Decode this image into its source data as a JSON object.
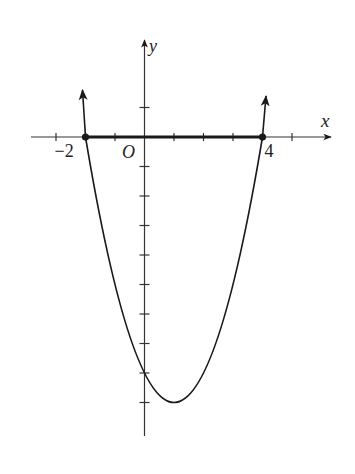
{
  "chart_data": {
    "type": "line",
    "title": "",
    "function": "y = x^2 - 2x - 8",
    "xlabel": "x",
    "ylabel": "y",
    "origin_label": "O",
    "x_tick_labels": [
      {
        "value": -2,
        "label": "−2"
      },
      {
        "value": 4,
        "label": "4"
      }
    ],
    "x_ticks": [
      -3,
      -2,
      -1,
      0,
      1,
      2,
      3,
      4,
      5
    ],
    "y_ticks": [
      1,
      -1,
      -2,
      -3,
      -4,
      -5,
      -6,
      -7,
      -8,
      -9
    ],
    "xlim": [
      -3.9,
      6.4
    ],
    "ylim": [
      -10.1,
      3.3
    ],
    "roots": [
      -2,
      4
    ],
    "vertex": [
      1,
      -9
    ],
    "y_intercept": -8,
    "highlighted_interval": [
      -2,
      4
    ],
    "x": [
      -2,
      -1,
      0,
      1,
      2,
      3,
      4
    ],
    "values": [
      0,
      -5,
      -8,
      -9,
      -8,
      -5,
      0
    ],
    "grid": false,
    "legend": null
  },
  "colors": {
    "ink": "#1a1a1a",
    "axis": "#333333",
    "background": "#ffffff"
  }
}
